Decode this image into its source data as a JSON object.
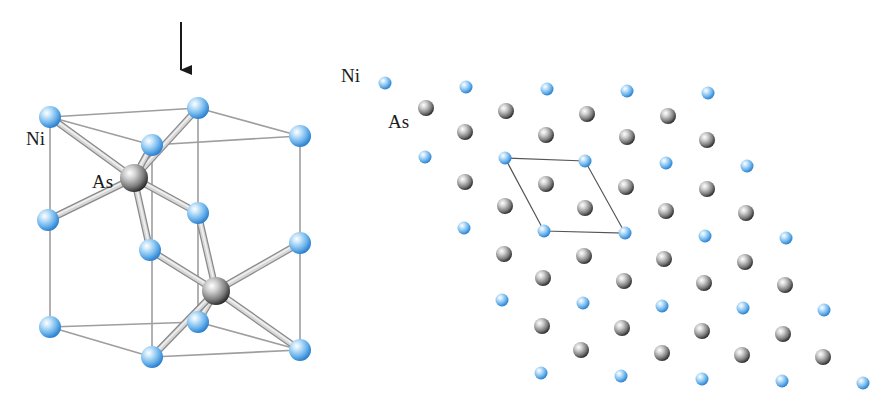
{
  "figure": {
    "left_panel": {
      "description": "Hexagonal NiAs unit cell in perspective view",
      "labels": {
        "ni": "Ni",
        "as": "As"
      },
      "label_positions": {
        "ni": [
          26,
          145
        ],
        "as": [
          92,
          188
        ]
      },
      "view_arrow": {
        "x": 181,
        "y1": 22,
        "y2": 82
      },
      "ni_atoms": [
        [
          50,
          117
        ],
        [
          198,
          108
        ],
        [
          300,
          136
        ],
        [
          152,
          145
        ],
        [
          48,
          220
        ],
        [
          198,
          213
        ],
        [
          300,
          243
        ],
        [
          150,
          250
        ],
        [
          50,
          327
        ],
        [
          198,
          322
        ],
        [
          300,
          350
        ],
        [
          152,
          357
        ]
      ],
      "as_atoms": [
        [
          134,
          178
        ],
        [
          216,
          291
        ]
      ],
      "cell_edges": [
        [
          [
            50,
            117
          ],
          [
            198,
            108
          ]
        ],
        [
          [
            198,
            108
          ],
          [
            300,
            136
          ]
        ],
        [
          [
            300,
            136
          ],
          [
            152,
            145
          ]
        ],
        [
          [
            152,
            145
          ],
          [
            50,
            117
          ]
        ],
        [
          [
            50,
            327
          ],
          [
            198,
            322
          ]
        ],
        [
          [
            198,
            322
          ],
          [
            300,
            350
          ]
        ],
        [
          [
            300,
            350
          ],
          [
            152,
            357
          ]
        ],
        [
          [
            152,
            357
          ],
          [
            50,
            327
          ]
        ],
        [
          [
            50,
            117
          ],
          [
            50,
            327
          ]
        ],
        [
          [
            198,
            108
          ],
          [
            198,
            322
          ]
        ],
        [
          [
            300,
            136
          ],
          [
            300,
            350
          ]
        ],
        [
          [
            152,
            145
          ],
          [
            152,
            357
          ]
        ]
      ],
      "bonds": [
        [
          [
            134,
            178
          ],
          [
            50,
            117
          ]
        ],
        [
          [
            134,
            178
          ],
          [
            198,
            108
          ]
        ],
        [
          [
            134,
            178
          ],
          [
            152,
            145
          ]
        ],
        [
          [
            134,
            178
          ],
          [
            48,
            220
          ]
        ],
        [
          [
            134,
            178
          ],
          [
            198,
            213
          ]
        ],
        [
          [
            134,
            178
          ],
          [
            150,
            250
          ]
        ],
        [
          [
            216,
            291
          ],
          [
            198,
            213
          ]
        ],
        [
          [
            216,
            291
          ],
          [
            150,
            250
          ]
        ],
        [
          [
            216,
            291
          ],
          [
            300,
            243
          ]
        ],
        [
          [
            216,
            291
          ],
          [
            198,
            322
          ]
        ],
        [
          [
            216,
            291
          ],
          [
            152,
            357
          ]
        ],
        [
          [
            216,
            291
          ],
          [
            300,
            350
          ]
        ]
      ]
    },
    "right_panel": {
      "description": "Projection of NiAs lattice viewed along c-axis with unit cell outlined",
      "labels": {
        "ni": "Ni",
        "as": "As"
      },
      "label_positions": {
        "ni": [
          341,
          82
        ],
        "as": [
          388,
          128
        ]
      },
      "unit_cell": [
        [
          505,
          158
        ],
        [
          585,
          161
        ],
        [
          625,
          233
        ],
        [
          544,
          231
        ]
      ],
      "ni_atoms": [
        [
          385,
          83
        ],
        [
          466,
          87
        ],
        [
          547,
          89
        ],
        [
          627,
          91
        ],
        [
          708,
          93
        ],
        [
          425,
          157
        ],
        [
          505,
          158
        ],
        [
          585,
          161
        ],
        [
          666,
          163
        ],
        [
          747,
          166
        ],
        [
          464,
          228
        ],
        [
          544,
          231
        ],
        [
          625,
          233
        ],
        [
          705,
          236
        ],
        [
          786,
          238
        ],
        [
          502,
          300
        ],
        [
          583,
          303
        ],
        [
          662,
          306
        ],
        [
          743,
          308
        ],
        [
          824,
          310
        ],
        [
          541,
          373
        ],
        [
          621,
          376
        ],
        [
          702,
          379
        ],
        [
          782,
          381
        ],
        [
          863,
          383
        ]
      ],
      "as_atoms": [
        [
          426,
          108
        ],
        [
          506,
          111
        ],
        [
          587,
          114
        ],
        [
          668,
          116
        ],
        [
          465,
          132
        ],
        [
          546,
          135
        ],
        [
          627,
          137
        ],
        [
          707,
          140
        ],
        [
          465,
          182
        ],
        [
          546,
          184
        ],
        [
          626,
          187
        ],
        [
          707,
          189
        ],
        [
          505,
          206
        ],
        [
          585,
          208
        ],
        [
          666,
          211
        ],
        [
          746,
          213
        ],
        [
          504,
          254
        ],
        [
          584,
          256
        ],
        [
          664,
          259
        ],
        [
          745,
          262
        ],
        [
          543,
          278
        ],
        [
          624,
          281
        ],
        [
          704,
          283
        ],
        [
          785,
          285
        ],
        [
          542,
          326
        ],
        [
          622,
          328
        ],
        [
          702,
          331
        ],
        [
          783,
          334
        ],
        [
          581,
          350
        ],
        [
          662,
          353
        ],
        [
          742,
          355
        ],
        [
          823,
          357
        ]
      ]
    },
    "colors": {
      "ni_light": "#e8f4ff",
      "ni_mid": "#7ec0f0",
      "ni_dark": "#2f86d6",
      "as_light": "#f4f4f4",
      "as_mid": "#9a9a9a",
      "as_dark": "#2a2a2a",
      "cell_line": "#9e9e9e",
      "bond_light": "#f0f0f0",
      "bond_dark": "#8a8a8a",
      "unit_cell_line": "#555555",
      "arrow": "#1a1a1a"
    }
  }
}
